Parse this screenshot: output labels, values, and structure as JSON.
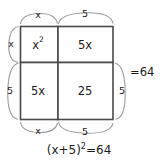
{
  "diagram": {
    "type": "area-model-completing-square",
    "grid": {
      "cells": [
        {
          "id": "top-left",
          "label": "x",
          "superscript": "2"
        },
        {
          "id": "top-right",
          "label": "5x",
          "superscript": ""
        },
        {
          "id": "bottom-left",
          "label": "5x",
          "superscript": ""
        },
        {
          "id": "bottom-right",
          "label": "25",
          "superscript": ""
        }
      ]
    },
    "dimensions": {
      "top_left": "x",
      "top_right": "5",
      "left_top": "x",
      "left_bottom": "5",
      "bottom_left": "x",
      "bottom_right": "5",
      "right_bottom": "5"
    },
    "result": "=64",
    "caption": {
      "base": "(x+5)",
      "exponent": "2",
      "tail": "=64"
    },
    "colors": {
      "cell_stroke": "#4a4a4a",
      "brace_stroke": "#9a9a9a",
      "text": "#1a1a1a",
      "background": "#ffffff"
    }
  }
}
